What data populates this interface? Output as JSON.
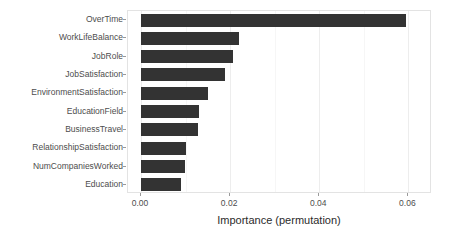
{
  "chart_data": {
    "type": "bar",
    "orientation": "horizontal",
    "title": "",
    "xlabel": "Importance (permutation)",
    "ylabel": "",
    "categories": [
      "OverTime",
      "WorkLifeBalance",
      "JobRole",
      "JobSatisfaction",
      "EnvironmentSatisfaction",
      "EducationField",
      "BusinessTravel",
      "RelationshipSatisfaction",
      "NumCompaniesWorked",
      "Education"
    ],
    "values": [
      0.0595,
      0.022,
      0.0206,
      0.0188,
      0.0151,
      0.0131,
      0.0129,
      0.01,
      0.0098,
      0.0089
    ],
    "xlim": [
      0.0,
      0.0635
    ],
    "xticks": [
      0.0,
      0.02,
      0.04,
      0.06
    ],
    "xtick_labels": [
      "0.00",
      "0.02",
      "0.04",
      "0.06"
    ],
    "xticks_minor": [
      0.01,
      0.03,
      0.05
    ],
    "grid": true,
    "legend": null,
    "bar_color": "#333333",
    "panel_background": "#ffffff",
    "gridline_color": "#ededed",
    "axis_text_color": "#4d4d4d"
  }
}
